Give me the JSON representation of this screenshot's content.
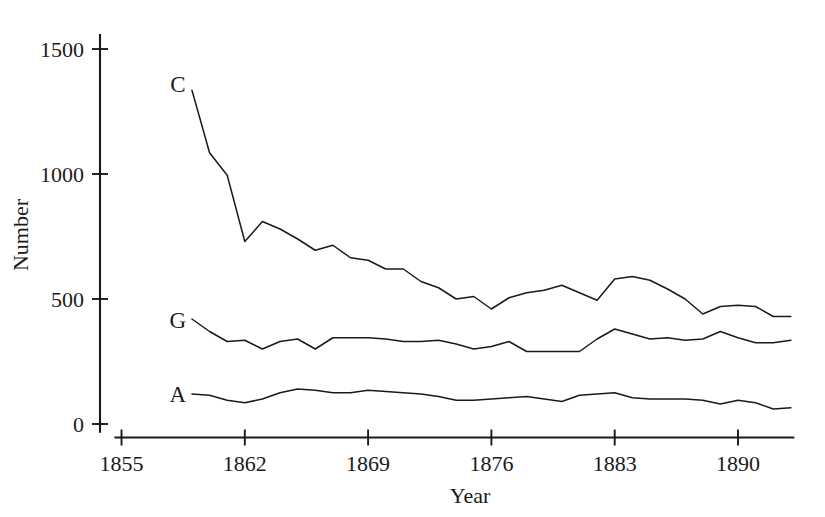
{
  "chart_data": {
    "type": "line",
    "title": "",
    "xlabel": "Year",
    "ylabel": "Number",
    "grid": false,
    "legend_position": "inline-labels",
    "xlim": [
      1855,
      1893
    ],
    "ylim": [
      0,
      1560
    ],
    "x_ticks": [
      1855,
      1862,
      1869,
      1876,
      1883,
      1890
    ],
    "x_tick_labels": [
      "1855",
      "1862",
      "1869",
      "1876",
      "1883",
      "1890"
    ],
    "y_ticks": [
      0,
      500,
      1000,
      1500
    ],
    "y_tick_labels": [
      "0",
      "500",
      "1000",
      "1500"
    ],
    "x": [
      1859,
      1860,
      1861,
      1862,
      1863,
      1864,
      1865,
      1866,
      1867,
      1868,
      1869,
      1870,
      1871,
      1872,
      1873,
      1874,
      1875,
      1876,
      1877,
      1878,
      1879,
      1880,
      1881,
      1882,
      1883,
      1884,
      1885,
      1886,
      1887,
      1888,
      1889,
      1890,
      1891,
      1892,
      1893
    ],
    "series": [
      {
        "name": "C",
        "label": "C",
        "label_x": 1858.2,
        "label_y": 1360,
        "values": [
          1335,
          1085,
          995,
          730,
          810,
          780,
          740,
          695,
          715,
          665,
          655,
          620,
          620,
          570,
          545,
          500,
          510,
          460,
          505,
          525,
          535,
          555,
          525,
          495,
          580,
          590,
          575,
          540,
          500,
          440,
          470,
          475,
          470,
          430,
          430
        ]
      },
      {
        "name": "G",
        "label": "G",
        "label_x": 1858.2,
        "label_y": 415,
        "values": [
          420,
          370,
          330,
          335,
          300,
          330,
          340,
          300,
          345,
          345,
          345,
          340,
          330,
          330,
          335,
          320,
          300,
          310,
          330,
          290,
          290,
          290,
          290,
          340,
          380,
          360,
          340,
          345,
          335,
          340,
          370,
          345,
          325,
          325,
          335
        ]
      },
      {
        "name": "A",
        "label": "A",
        "label_x": 1858.2,
        "label_y": 120,
        "values": [
          120,
          115,
          95,
          85,
          100,
          125,
          140,
          135,
          125,
          125,
          135,
          130,
          125,
          120,
          110,
          95,
          95,
          100,
          105,
          110,
          100,
          90,
          115,
          120,
          125,
          105,
          100,
          100,
          100,
          95,
          80,
          95,
          85,
          60,
          65
        ]
      }
    ]
  }
}
